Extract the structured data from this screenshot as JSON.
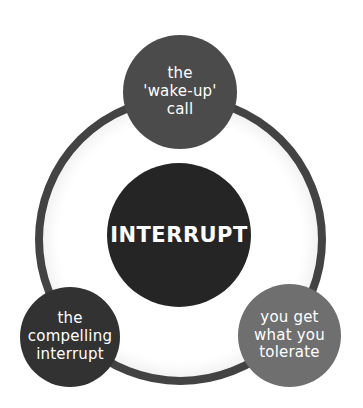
{
  "diagram": {
    "center": {
      "label": "INTERRUPT",
      "color": "#252525"
    },
    "nodes": [
      {
        "position": "top",
        "lines": [
          "the",
          "'wake-up'",
          "call"
        ],
        "color": "#4b4b4b"
      },
      {
        "position": "bottom-left",
        "lines": [
          "the",
          "compelling",
          "interrupt"
        ],
        "color": "#323232"
      },
      {
        "position": "bottom-right",
        "lines": [
          "you get",
          "what you",
          "tolerate"
        ],
        "color": "#6f6f6f"
      }
    ],
    "ring_color": "#434343"
  }
}
